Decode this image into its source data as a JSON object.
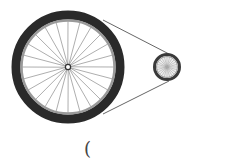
{
  "diagram": {
    "large_wheel": {
      "cx": 68,
      "cy": 67,
      "r": 56,
      "spokes": 24,
      "tire_color": "#2a2a2a",
      "rim_color": "#9a9a9a"
    },
    "small_wheel": {
      "cx": 167,
      "cy": 67,
      "r": 14,
      "spokes": 24,
      "tire_color": "#3a3a3a",
      "rim_color": "#9a9a9a"
    },
    "belt_color": "#555555"
  },
  "caption": {
    "text": "("
  }
}
